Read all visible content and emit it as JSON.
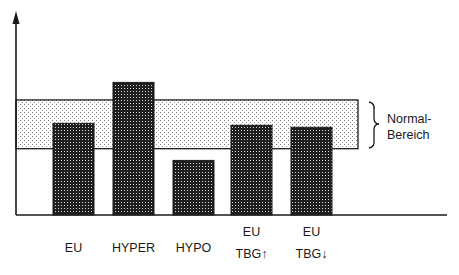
{
  "chart_data": {
    "type": "bar",
    "title": "",
    "xlabel": "",
    "ylabel": "",
    "y_units": "relative (no scale shown)",
    "ylim": [
      0,
      100
    ],
    "grid": false,
    "categories": [
      [
        "EU"
      ],
      [
        "HYPER"
      ],
      [
        "HYPO"
      ],
      [
        "EU",
        "TBG↑"
      ],
      [
        "EU",
        "TBG↓"
      ]
    ],
    "values": [
      47,
      68,
      28,
      46,
      45
    ],
    "normal_range": {
      "label_lines": [
        "Normal-",
        "Bereich"
      ],
      "lower": 34,
      "upper": 59
    },
    "styles": {
      "bar_fill": "#2b2b2b",
      "bar_pattern": "checkered",
      "band_fill": "#f4f4f4",
      "band_pattern": "dotted",
      "axis_color": "#1a1a1a"
    }
  }
}
